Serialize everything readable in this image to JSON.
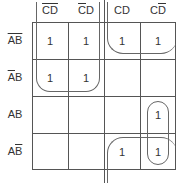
{
  "kmap": {
    "columns": [
      {
        "parts": [
          {
            "t": "C",
            "bar": true
          },
          {
            "t": "D",
            "bar": true
          }
        ]
      },
      {
        "parts": [
          {
            "t": "C",
            "bar": true
          },
          {
            "t": "D",
            "bar": false
          }
        ]
      },
      {
        "parts": [
          {
            "t": "C",
            "bar": false
          },
          {
            "t": "D",
            "bar": false
          }
        ]
      },
      {
        "parts": [
          {
            "t": "C",
            "bar": false
          },
          {
            "t": "D",
            "bar": true
          }
        ]
      }
    ],
    "rows": [
      {
        "parts": [
          {
            "t": "A",
            "bar": true
          },
          {
            "t": "B",
            "bar": true
          }
        ]
      },
      {
        "parts": [
          {
            "t": "A",
            "bar": true
          },
          {
            "t": "B",
            "bar": false
          }
        ]
      },
      {
        "parts": [
          {
            "t": "A",
            "bar": false
          },
          {
            "t": "B",
            "bar": false
          }
        ]
      },
      {
        "parts": [
          {
            "t": "A",
            "bar": false
          },
          {
            "t": "B",
            "bar": true
          }
        ]
      }
    ],
    "column_labels": [
      "C̄D̄",
      "C̄D",
      "CD",
      "CD̄"
    ],
    "row_labels": [
      "ĀB̄",
      "ĀB",
      "AB",
      "AB̄"
    ],
    "cells": [
      [
        "1",
        "1",
        "1",
        "1"
      ],
      [
        "1",
        "1",
        "",
        ""
      ],
      [
        "",
        "",
        "",
        "1"
      ],
      [
        "",
        "",
        "1",
        "1"
      ]
    ],
    "groups": [
      "rows 0-1, cols 0-1 (quad)",
      "row 0, cols 2-3 wrapping from top",
      "rows 2-3, col 3 (pair)",
      "row 3, cols 2-3 wrapping from bottom"
    ]
  }
}
